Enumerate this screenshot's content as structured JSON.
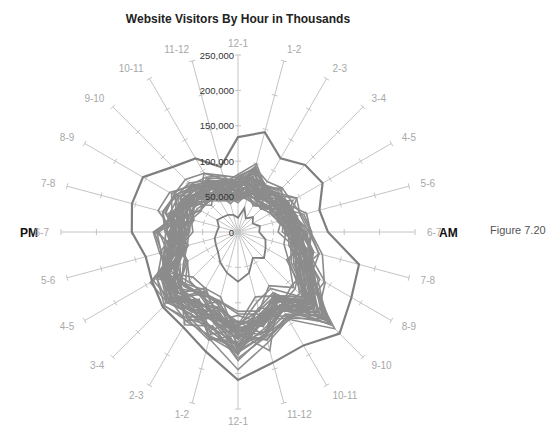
{
  "title": "Website Visitors By Hour in Thousands",
  "side_labels": {
    "left": "PM",
    "right": "AM"
  },
  "figure_label": "Figure 7.20",
  "colors": {
    "axis": "#c4c4c4",
    "series": "#8c8c8c",
    "envelope": "#7e7e7e",
    "category_text": "#a8a8a8",
    "tick_text": "#333333"
  },
  "chart_data": {
    "type": "radar",
    "title": "Website Visitors By Hour in Thousands",
    "categories": [
      "12-1",
      "1-2",
      "2-3",
      "3-4",
      "4-5",
      "5-6",
      "6-7",
      "7-8",
      "8-9",
      "9-10",
      "10-11",
      "11-12",
      "12-1",
      "1-2",
      "2-3",
      "3-4",
      "4-5",
      "5-6",
      "6-7",
      "7-8",
      "8-9",
      "9-10",
      "10-11",
      "11-12"
    ],
    "category_groups": {
      "AM": "first 12 axes (right half, clockwise from top)",
      "PM": "last 12 axes (left half)"
    },
    "radial_ticks": [
      "0",
      "50,000",
      "100,000",
      "150,000",
      "200,000",
      "250,000"
    ],
    "rlim": [
      0,
      250000
    ],
    "grid": true,
    "legend": "none",
    "series": [
      {
        "name": "max_envelope",
        "values": [
          134000,
          146000,
          120000,
          134000,
          138000,
          119000,
          127000,
          177000,
          185000,
          203000,
          185000,
          191000,
          209000,
          175000,
          155000,
          150000,
          140000,
          135000,
          150000,
          155000,
          155000,
          130000,
          120000,
          95000
        ]
      },
      {
        "name": "min_inner",
        "values": [
          20000,
          35000,
          22000,
          30000,
          24000,
          32000,
          30000,
          40000,
          45000,
          52000,
          42000,
          60000,
          70000,
          60000,
          50000,
          40000,
          36000,
          34000,
          30000,
          28000,
          34000,
          30000,
          28000,
          25000
        ]
      },
      {
        "name": "typical_1",
        "values": [
          58000,
          70000,
          62000,
          66000,
          70000,
          74000,
          80000,
          95000,
          110000,
          150000,
          120000,
          135000,
          150000,
          130000,
          120000,
          125000,
          112000,
          95000,
          90000,
          88000,
          85000,
          78000,
          72000,
          62000
        ]
      },
      {
        "name": "typical_2",
        "values": [
          52000,
          62000,
          58000,
          60000,
          64000,
          68000,
          74000,
          90000,
          104000,
          140000,
          112000,
          125000,
          140000,
          122000,
          112000,
          115000,
          105000,
          88000,
          82000,
          80000,
          78000,
          70000,
          66000,
          56000
        ]
      },
      {
        "name": "typical_3",
        "values": [
          64000,
          80000,
          70000,
          72000,
          76000,
          80000,
          86000,
          100000,
          118000,
          160000,
          128000,
          145000,
          160000,
          140000,
          128000,
          132000,
          118000,
          102000,
          96000,
          94000,
          92000,
          84000,
          78000,
          68000
        ]
      },
      {
        "name": "typical_4",
        "values": [
          48000,
          56000,
          52000,
          55000,
          58000,
          62000,
          68000,
          82000,
          96000,
          130000,
          104000,
          115000,
          130000,
          112000,
          104000,
          108000,
          98000,
          82000,
          76000,
          74000,
          72000,
          64000,
          60000,
          50000
        ]
      },
      {
        "name": "typical_5",
        "values": [
          70000,
          92000,
          74000,
          78000,
          82000,
          86000,
          92000,
          106000,
          124000,
          168000,
          134000,
          150000,
          168000,
          146000,
          134000,
          138000,
          124000,
          108000,
          102000,
          100000,
          98000,
          90000,
          84000,
          74000
        ]
      }
    ],
    "generated_variants_per_series": 8
  }
}
